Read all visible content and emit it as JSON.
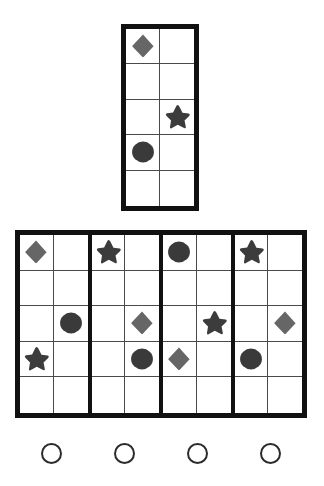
{
  "puzzle": {
    "title": "Matrix Reasoning Puzzle",
    "shape_colors": {
      "diamond": "#666666",
      "star": "#3c3c3c",
      "circle": "#3a3a3a",
      "grid_line": "#4a4a4a",
      "grid_border": "#111111",
      "background": "#ffffff",
      "radio_stroke": "#2b2b2b"
    },
    "question_matrix": {
      "name": "question-matrix",
      "rows": 5,
      "cols": 2,
      "cells": [
        [
          {
            "shape": "diamond"
          },
          {
            "shape": null
          }
        ],
        [
          {
            "shape": null
          },
          {
            "shape": null
          }
        ],
        [
          {
            "shape": null
          },
          {
            "shape": "star"
          }
        ],
        [
          {
            "shape": "circle"
          },
          {
            "shape": null
          }
        ],
        [
          {
            "shape": null
          },
          {
            "shape": null
          }
        ]
      ]
    },
    "options": [
      {
        "label": "A",
        "index": 1,
        "rows": 5,
        "cols": 2,
        "cells": [
          [
            {
              "shape": "diamond"
            },
            {
              "shape": null
            }
          ],
          [
            {
              "shape": null
            },
            {
              "shape": null
            }
          ],
          [
            {
              "shape": null
            },
            {
              "shape": "circle"
            }
          ],
          [
            {
              "shape": "star"
            },
            {
              "shape": null
            }
          ],
          [
            {
              "shape": null
            },
            {
              "shape": null
            }
          ]
        ]
      },
      {
        "label": "B",
        "index": 2,
        "rows": 5,
        "cols": 2,
        "cells": [
          [
            {
              "shape": "star"
            },
            {
              "shape": null
            }
          ],
          [
            {
              "shape": null
            },
            {
              "shape": null
            }
          ],
          [
            {
              "shape": null
            },
            {
              "shape": "diamond"
            }
          ],
          [
            {
              "shape": null
            },
            {
              "shape": "circle"
            }
          ],
          [
            {
              "shape": null
            },
            {
              "shape": null
            }
          ]
        ]
      },
      {
        "label": "C",
        "index": 3,
        "rows": 5,
        "cols": 2,
        "cells": [
          [
            {
              "shape": "circle"
            },
            {
              "shape": null
            }
          ],
          [
            {
              "shape": null
            },
            {
              "shape": null
            }
          ],
          [
            {
              "shape": null
            },
            {
              "shape": "star"
            }
          ],
          [
            {
              "shape": "diamond"
            },
            {
              "shape": null
            }
          ],
          [
            {
              "shape": null
            },
            {
              "shape": null
            }
          ]
        ]
      },
      {
        "label": "D",
        "index": 4,
        "rows": 5,
        "cols": 2,
        "cells": [
          [
            {
              "shape": "star"
            },
            {
              "shape": null
            }
          ],
          [
            {
              "shape": null
            },
            {
              "shape": null
            }
          ],
          [
            {
              "shape": null
            },
            {
              "shape": "diamond"
            }
          ],
          [
            {
              "shape": "circle"
            },
            {
              "shape": null
            }
          ],
          [
            {
              "shape": null
            },
            {
              "shape": null
            }
          ]
        ]
      }
    ],
    "answer_choices": [
      {
        "index": 1,
        "selected": false
      },
      {
        "index": 2,
        "selected": false
      },
      {
        "index": 3,
        "selected": false
      },
      {
        "index": 4,
        "selected": false
      }
    ]
  }
}
